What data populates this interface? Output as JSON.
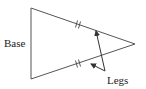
{
  "diagram": {
    "colors": {
      "line": "#555555",
      "text": "#222222",
      "background": "#ffffff"
    },
    "vertices": {
      "top_left": [
        31,
        8
      ],
      "bottom_left": [
        31,
        79
      ],
      "apex": [
        135,
        44
      ]
    },
    "labels": {
      "base": "Base",
      "legs": "Legs"
    },
    "tick_marks": {
      "style": "double",
      "upper_leg": [
        78,
        24
      ],
      "lower_leg": [
        78,
        64
      ]
    },
    "arrows": [
      {
        "from": [
          105,
          71
        ],
        "to": [
          96,
          31
        ],
        "target": "upper-leg"
      },
      {
        "from": [
          105,
          71
        ],
        "to": [
          91,
          64
        ],
        "target": "lower-leg"
      }
    ]
  }
}
